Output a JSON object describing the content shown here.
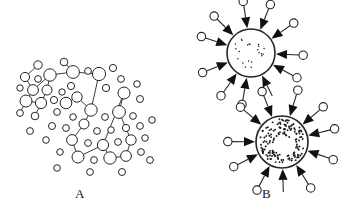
{
  "figure": {
    "width": 343,
    "height": 217,
    "background_color": "#ffffff",
    "stroke_color": "#262626",
    "fill_color": "#ffffff",
    "dot_color": "#1a1a1a",
    "arrow_color": "#111111"
  },
  "panels": [
    {
      "id": "panel-a",
      "label": "A",
      "label_x": 75,
      "label_y": 186,
      "description": "dispersed network of open circles joined by thin line segments"
    },
    {
      "id": "panel-b",
      "label": "B",
      "label_x": 262,
      "label_y": 186,
      "description": "two spherical particles with radiating spokes terminating in open circles and inward-pointing solid arrowheads"
    }
  ],
  "chart_data": {
    "type": "scatter",
    "title": "",
    "xlabel": "",
    "ylabel": "",
    "panel_a": {
      "nodes": [
        {
          "x": 38,
          "y": 65,
          "r": 4.2
        },
        {
          "x": 25,
          "y": 77,
          "r": 4.6
        },
        {
          "x": 38,
          "y": 79,
          "r": 3.4
        },
        {
          "x": 50,
          "y": 75,
          "r": 6.2
        },
        {
          "x": 20,
          "y": 88,
          "r": 3.2
        },
        {
          "x": 33,
          "y": 90,
          "r": 5.4
        },
        {
          "x": 47,
          "y": 90,
          "r": 5.0
        },
        {
          "x": 26,
          "y": 101,
          "r": 6.0
        },
        {
          "x": 41,
          "y": 103,
          "r": 5.6
        },
        {
          "x": 54,
          "y": 100,
          "r": 3.6
        },
        {
          "x": 20,
          "y": 113,
          "r": 3.4
        },
        {
          "x": 35,
          "y": 116,
          "r": 3.8
        },
        {
          "x": 64,
          "y": 62,
          "r": 3.8
        },
        {
          "x": 73,
          "y": 72,
          "r": 6.4
        },
        {
          "x": 88,
          "y": 71,
          "r": 3.4
        },
        {
          "x": 71,
          "y": 86,
          "r": 3.6
        },
        {
          "x": 62,
          "y": 92,
          "r": 3.2
        },
        {
          "x": 77,
          "y": 97,
          "r": 5.2
        },
        {
          "x": 66,
          "y": 103,
          "r": 5.8
        },
        {
          "x": 57,
          "y": 112,
          "r": 3.4
        },
        {
          "x": 73,
          "y": 117,
          "r": 3.3
        },
        {
          "x": 99,
          "y": 74,
          "r": 6.6
        },
        {
          "x": 113,
          "y": 68,
          "r": 3.6
        },
        {
          "x": 106,
          "y": 88,
          "r": 3.6
        },
        {
          "x": 121,
          "y": 79,
          "r": 3.4
        },
        {
          "x": 124,
          "y": 93,
          "r": 6.0
        },
        {
          "x": 137,
          "y": 84,
          "r": 3.3
        },
        {
          "x": 140,
          "y": 99,
          "r": 3.5
        },
        {
          "x": 91,
          "y": 110,
          "r": 6.2
        },
        {
          "x": 105,
          "y": 117,
          "r": 3.4
        },
        {
          "x": 119,
          "y": 112,
          "r": 6.4
        },
        {
          "x": 133,
          "y": 116,
          "r": 3.4
        },
        {
          "x": 84,
          "y": 124,
          "r": 5.0
        },
        {
          "x": 97,
          "y": 131,
          "r": 3.4
        },
        {
          "x": 111,
          "y": 130,
          "r": 3.3
        },
        {
          "x": 126,
          "y": 128,
          "r": 3.6
        },
        {
          "x": 140,
          "y": 126,
          "r": 3.4
        },
        {
          "x": 66,
          "y": 128,
          "r": 3.4
        },
        {
          "x": 52,
          "y": 126,
          "r": 3.5
        },
        {
          "x": 72,
          "y": 140,
          "r": 5.4
        },
        {
          "x": 88,
          "y": 143,
          "r": 3.4
        },
        {
          "x": 103,
          "y": 145,
          "r": 5.6
        },
        {
          "x": 118,
          "y": 142,
          "r": 3.4
        },
        {
          "x": 131,
          "y": 140,
          "r": 5.2
        },
        {
          "x": 145,
          "y": 138,
          "r": 3.3
        },
        {
          "x": 60,
          "y": 152,
          "r": 3.3
        },
        {
          "x": 78,
          "y": 157,
          "r": 6.0
        },
        {
          "x": 94,
          "y": 160,
          "r": 3.4
        },
        {
          "x": 110,
          "y": 158,
          "r": 6.2
        },
        {
          "x": 126,
          "y": 156,
          "r": 5.4
        },
        {
          "x": 141,
          "y": 152,
          "r": 3.4
        },
        {
          "x": 46,
          "y": 140,
          "r": 3.3
        },
        {
          "x": 30,
          "y": 131,
          "r": 3.4
        },
        {
          "x": 57,
          "y": 168,
          "r": 3.3
        },
        {
          "x": 90,
          "y": 172,
          "r": 3.4
        },
        {
          "x": 122,
          "y": 172,
          "r": 3.5
        },
        {
          "x": 152,
          "y": 120,
          "r": 3.3
        },
        {
          "x": 150,
          "y": 160,
          "r": 3.4
        }
      ],
      "edges": [
        [
          38,
          65,
          25,
          77
        ],
        [
          25,
          77,
          33,
          90
        ],
        [
          33,
          90,
          50,
          75
        ],
        [
          50,
          75,
          73,
          72
        ],
        [
          33,
          90,
          26,
          101
        ],
        [
          26,
          101,
          41,
          103
        ],
        [
          41,
          103,
          47,
          90
        ],
        [
          47,
          90,
          50,
          75
        ],
        [
          73,
          72,
          64,
          62
        ],
        [
          73,
          72,
          99,
          74
        ],
        [
          99,
          74,
          91,
          110
        ],
        [
          91,
          110,
          77,
          97
        ],
        [
          77,
          97,
          66,
          103
        ],
        [
          91,
          110,
          84,
          124
        ],
        [
          84,
          124,
          72,
          140
        ],
        [
          72,
          140,
          78,
          157
        ],
        [
          78,
          157,
          103,
          145
        ],
        [
          103,
          145,
          124,
          93
        ],
        [
          124,
          93,
          119,
          112
        ],
        [
          119,
          112,
          131,
          140
        ],
        [
          103,
          145,
          110,
          158
        ],
        [
          110,
          158,
          126,
          156
        ],
        [
          126,
          156,
          131,
          140
        ],
        [
          26,
          101,
          20,
          113
        ],
        [
          41,
          103,
          35,
          116
        ]
      ]
    },
    "panel_b": {
      "particles": [
        {
          "id": "particle-top",
          "cx": 251,
          "cy": 53,
          "r": 24,
          "interior": "sparse-dots",
          "dot_count": 22,
          "spoke_count": 11
        },
        {
          "id": "particle-bottom",
          "cx": 282,
          "cy": 142,
          "r": 26,
          "interior": "dense-dot-annulus",
          "dot_count": 150,
          "spoke_count": 11
        }
      ],
      "spoke": {
        "terminal_marker": "open-circle",
        "terminal_radius": 4.2,
        "head": "solid-triangle-inward"
      }
    }
  }
}
